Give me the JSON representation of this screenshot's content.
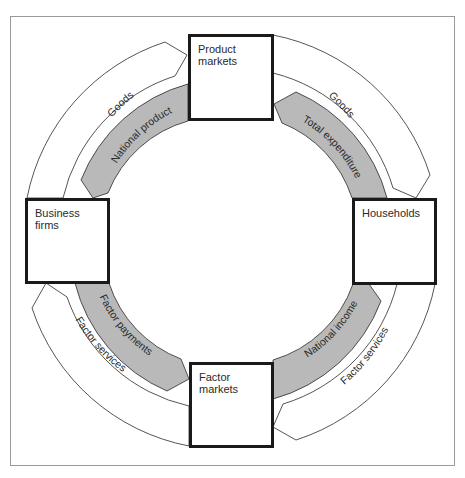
{
  "diagram": {
    "colors": {
      "background": "#ffffff",
      "frame_border": "#9a9a9a",
      "box_border": "#1a1a1a",
      "money_flow_fill": "#b9b9b9",
      "real_flow_fill": "#ffffff",
      "stroke": "#2a2a2a"
    },
    "nodes": {
      "product_markets": "Product\nmarkets",
      "business_firms": "Business\nfirms",
      "households": "Households",
      "factor_markets": "Factor\nmarkets"
    },
    "flows": {
      "goods_left": "Goods",
      "goods_right": "Goods",
      "national_product": "National product",
      "total_expenditure": "Total expenditure",
      "factor_payments": "Factor payments",
      "national_income": "National income",
      "factor_services_left": "Factor services",
      "factor_services_right": "Factor services"
    }
  }
}
